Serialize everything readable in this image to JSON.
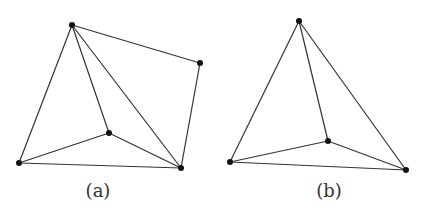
{
  "figures": [
    {
      "caption": "(a)",
      "caption_pos": [
        98,
        182
      ],
      "vertices": [
        [
          72,
          25
        ],
        [
          200,
          63
        ],
        [
          109,
          133
        ],
        [
          19,
          163
        ],
        [
          181,
          168
        ]
      ],
      "edges": [
        [
          0,
          1
        ],
        [
          1,
          4
        ],
        [
          0,
          3
        ],
        [
          0,
          2
        ],
        [
          0,
          4
        ],
        [
          3,
          2
        ],
        [
          2,
          4
        ],
        [
          3,
          4
        ]
      ]
    },
    {
      "caption": "(b)",
      "caption_pos": [
        329,
        182
      ],
      "vertices": [
        [
          299,
          21
        ],
        [
          328,
          141
        ],
        [
          230,
          162
        ],
        [
          406,
          170
        ]
      ],
      "edges": [
        [
          0,
          2
        ],
        [
          0,
          1
        ],
        [
          0,
          3
        ],
        [
          2,
          1
        ],
        [
          1,
          3
        ],
        [
          2,
          3
        ]
      ]
    }
  ],
  "colors": {
    "stroke": "#333333",
    "vertex": "#111111"
  }
}
